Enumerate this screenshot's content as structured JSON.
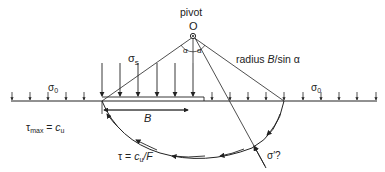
{
  "diagram": {
    "pivot_label": "pivot",
    "pivot_point": "O",
    "angle_left": "α",
    "angle_right": "α",
    "radius_label": {
      "prefix": "radius ",
      "var": "B",
      "suffix": "/sin α"
    },
    "surcharge_left": {
      "sym": "σ",
      "sub": "0"
    },
    "surcharge_right": {
      "sym": "σ",
      "sub": "0"
    },
    "footing_stress": {
      "sym": "σ",
      "sub": "s"
    },
    "footing_width": "B",
    "tau_max": {
      "sym": "τ",
      "sub": "max",
      "eq": " = ",
      "rhs": "c",
      "rhs_sub": "u"
    },
    "tau_mobilised": {
      "sym": "τ",
      "eq": " = ",
      "rhs": "c",
      "rhs_sub": "u",
      "tail": "/F"
    },
    "normal_stress_unknown": "σ′?"
  }
}
